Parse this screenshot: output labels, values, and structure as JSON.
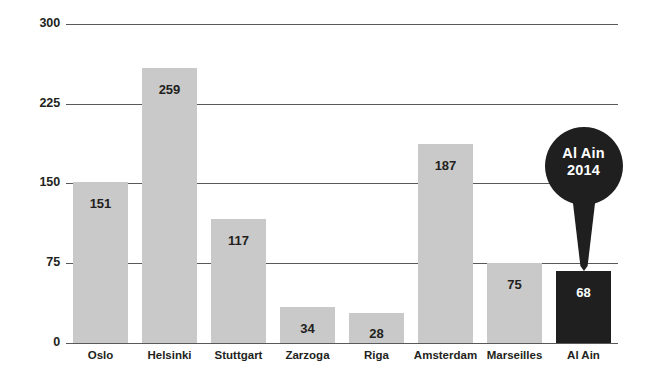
{
  "chart_data": {
    "type": "bar",
    "title": "",
    "subtitle": "",
    "xlabel": "",
    "ylabel": "",
    "categories": [
      "Oslo",
      "Helsinki",
      "Stuttgart",
      "Zarzoga",
      "Riga",
      "Amsterdam",
      "Marseilles",
      "Al Ain"
    ],
    "values": [
      151,
      259,
      117,
      34,
      28,
      187,
      75,
      68
    ],
    "value_labels": [
      "151",
      "259",
      "117",
      "34",
      "28",
      "187",
      "75",
      "68"
    ],
    "ylim": [
      0,
      300
    ],
    "yticks": [
      0,
      75,
      150,
      225,
      300
    ],
    "ytick_labels": [
      "0",
      "75",
      "150",
      "225",
      "300"
    ],
    "grid": "horizontal",
    "legend": "none",
    "bar_color": "#c9c9c9",
    "highlight_color": "#1f1f1f",
    "highlight_category": "Al Ain",
    "gridline_color": "#58595b",
    "background": "#ffffff",
    "annotations": [
      {
        "name": "al-ain-callout",
        "kind": "speech-bubble-pin",
        "target_category": "Al Ain",
        "line1": "Al Ain",
        "line2": "2014",
        "fill": "#1f1f1f",
        "text_color": "#ffffff"
      }
    ]
  },
  "axes": {
    "y": {
      "ticks": [
        {
          "label": "300",
          "value": 300
        },
        {
          "label": "225",
          "value": 225
        },
        {
          "label": "150",
          "value": 150
        },
        {
          "label": "75",
          "value": 75
        },
        {
          "label": "0",
          "value": 0
        }
      ]
    },
    "x": {
      "labels": [
        "Oslo",
        "Helsinki",
        "Stuttgart",
        "Zarzoga",
        "Riga",
        "Amsterdam",
        "Marseilles",
        "Al Ain"
      ]
    }
  },
  "callout": {
    "line1": "Al Ain",
    "line2": "2014"
  }
}
